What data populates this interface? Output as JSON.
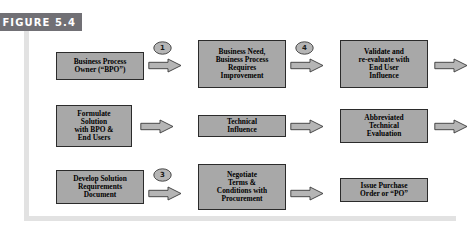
{
  "banner": {
    "label": "FIGURE 5.4",
    "background_color": "#717075",
    "text_color": "#ffffff"
  },
  "colors": {
    "node_fill": "#a8a8a8",
    "node_border": "#2b2b2b",
    "arrow_fill": "#b5b5b5",
    "arrow_stroke": "#3a3a3a",
    "frame_rule": "#e2e2e2",
    "page_background": "#ffffff"
  },
  "diagram": {
    "rows": [
      {
        "id": "row-0",
        "nodes": [
          {
            "id": "business-process-owner",
            "label": "Business Process\nOwner (“BPO”)",
            "x": 56,
            "y": 16,
            "w": 88,
            "h": 28
          },
          {
            "id": "business-need",
            "label": "Business Need,\nBusiness Process\nRequires\nImprovement",
            "x": 198,
            "y": 4,
            "w": 88,
            "h": 48
          },
          {
            "id": "validate-re-evaluate",
            "label": "Validate and\nre-evaluate with\nEnd User\nInfluence",
            "x": 340,
            "y": 4,
            "w": 88,
            "h": 48
          }
        ],
        "arrows": [
          {
            "id": "arrow-r0-a",
            "x": 148,
            "y": 22
          },
          {
            "id": "arrow-r0-b",
            "x": 290,
            "y": 22
          },
          {
            "id": "arrow-r0-out",
            "x": 434,
            "y": 22
          }
        ],
        "markers": [
          {
            "id": "marker-1",
            "value": "1",
            "x": 153,
            "y": 5
          },
          {
            "id": "marker-4",
            "value": "4",
            "x": 295,
            "y": 5
          }
        ]
      },
      {
        "id": "row-1",
        "nodes": [
          {
            "id": "formulate-solution",
            "label": "Formulate\nSolution\nwith BPO &\nEnd Users",
            "x": 56,
            "y": 8,
            "w": 76,
            "h": 42
          },
          {
            "id": "technical-influence",
            "label": "Technical\nInfluence",
            "x": 198,
            "y": 18,
            "w": 88,
            "h": 22
          },
          {
            "id": "abbreviated-technical-evaluation",
            "label": "Abbreviated\nTechnical\nEvaluation",
            "x": 340,
            "y": 12,
            "w": 88,
            "h": 34
          }
        ],
        "arrows": [
          {
            "id": "arrow-r1-a",
            "x": 140,
            "y": 22
          },
          {
            "id": "arrow-r1-b",
            "x": 290,
            "y": 22
          },
          {
            "id": "arrow-r1-out",
            "x": 434,
            "y": 22
          }
        ],
        "markers": []
      },
      {
        "id": "row-2",
        "nodes": [
          {
            "id": "develop-solution-requirements",
            "label": "Develop Solution\nRequirements\nDocument",
            "x": 56,
            "y": 12,
            "w": 88,
            "h": 34
          },
          {
            "id": "negotiate-terms",
            "label": "Negotiate\nTerms &\nConditions with\nProcurement",
            "x": 198,
            "y": 6,
            "w": 88,
            "h": 46
          },
          {
            "id": "issue-purchase-order",
            "label": "Issue Purchase\nOrder or “PO”",
            "x": 340,
            "y": 20,
            "w": 88,
            "h": 24
          }
        ],
        "arrows": [
          {
            "id": "arrow-r2-a",
            "x": 148,
            "y": 28
          },
          {
            "id": "arrow-r2-b",
            "x": 290,
            "y": 28
          }
        ],
        "markers": [
          {
            "id": "marker-3",
            "value": "3",
            "x": 153,
            "y": 10
          }
        ]
      }
    ]
  }
}
